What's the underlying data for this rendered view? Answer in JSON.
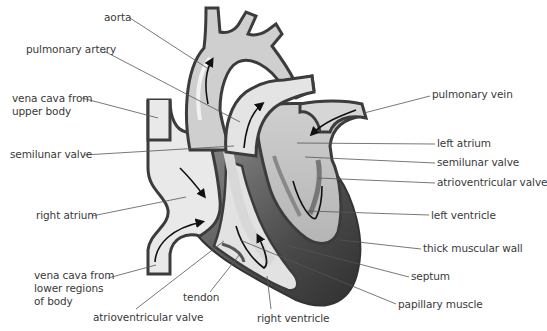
{
  "diagram": {
    "colors": {
      "background": "#ffffff",
      "outline": "#3c3c3c",
      "vessel_fill": "#c9c9c9",
      "vessel_highlight": "#ececec",
      "chamber_light": "#e6e6e6",
      "left_side_fill": "#bdbdbd",
      "muscle_dark": "#555555",
      "leader_line": "#555555",
      "text": "#3a3a3a"
    },
    "labels": [
      {
        "id": "aorta",
        "text": "aorta",
        "x": 104,
        "y": 11,
        "align": "left",
        "line": [
          [
            130,
            18
          ],
          [
            207,
            68
          ]
        ]
      },
      {
        "id": "pulmonary-artery",
        "text": "pulmonary artery",
        "x": 26,
        "y": 43,
        "align": "left",
        "line": [
          [
            104,
            51
          ],
          [
            240,
            122
          ]
        ]
      },
      {
        "id": "vena-cava-upper",
        "text": "vena cava from\nupper body",
        "x": 12,
        "y": 92,
        "align": "left",
        "line": [
          [
            82,
            98
          ],
          [
            158,
            118
          ]
        ]
      },
      {
        "id": "semilunar-valve-left",
        "text": "semilunar valve",
        "x": 10,
        "y": 148,
        "align": "left",
        "line": [
          [
            84,
            155
          ],
          [
            234,
            146
          ]
        ]
      },
      {
        "id": "pulmonary-vein",
        "text": "pulmonary vein",
        "x": 432,
        "y": 88,
        "align": "left",
        "line": [
          [
            430,
            96
          ],
          [
            364,
            113
          ]
        ]
      },
      {
        "id": "left-atrium",
        "text": "left atrium",
        "x": 437,
        "y": 137,
        "align": "left",
        "line": [
          [
            435,
            144
          ],
          [
            297,
            143
          ]
        ]
      },
      {
        "id": "semilunar-valve-right",
        "text": "semilunar valve",
        "x": 437,
        "y": 156,
        "align": "left",
        "line": [
          [
            435,
            163
          ],
          [
            305,
            157
          ]
        ]
      },
      {
        "id": "atrioventricular-valve-right",
        "text": "atrioventricular valve",
        "x": 437,
        "y": 176,
        "align": "left",
        "line": [
          [
            435,
            183
          ],
          [
            318,
            178
          ]
        ]
      },
      {
        "id": "right-atrium",
        "text": "right atrium",
        "x": 36,
        "y": 209,
        "align": "left",
        "line": [
          [
            92,
            216
          ],
          [
            186,
            197
          ]
        ]
      },
      {
        "id": "left-ventricle",
        "text": "left ventricle",
        "x": 431,
        "y": 209,
        "align": "left",
        "line": [
          [
            429,
            215
          ],
          [
            307,
            211
          ]
        ]
      },
      {
        "id": "thick-muscular-wall",
        "text": "thick muscular wall",
        "x": 423,
        "y": 242,
        "align": "left",
        "line": [
          [
            421,
            249
          ],
          [
            340,
            240
          ]
        ]
      },
      {
        "id": "vena-cava-lower",
        "text": "vena cava from\nlower regions\nof body",
        "x": 34,
        "y": 269,
        "align": "left",
        "line": [
          [
            108,
            278
          ],
          [
            156,
            265
          ]
        ]
      },
      {
        "id": "septum",
        "text": "septum",
        "x": 411,
        "y": 270,
        "align": "left",
        "line": [
          [
            409,
            277
          ],
          [
            286,
            245
          ]
        ]
      },
      {
        "id": "papillary-muscle",
        "text": "papillary muscle",
        "x": 398,
        "y": 298,
        "align": "left",
        "line": [
          [
            396,
            304
          ],
          [
            240,
            240
          ]
        ]
      },
      {
        "id": "tendon",
        "text": "tendon",
        "x": 183,
        "y": 291,
        "align": "left",
        "line": [
          [
            210,
            292
          ],
          [
            240,
            254
          ]
        ]
      },
      {
        "id": "atrioventricular-valve-left",
        "text": "atrioventricular valve",
        "x": 93,
        "y": 311,
        "align": "left",
        "line": [
          [
            136,
            309
          ],
          [
            224,
            241
          ]
        ]
      },
      {
        "id": "right-ventricle",
        "text": "right ventricle",
        "x": 257,
        "y": 312,
        "align": "left",
        "line": [
          [
            271,
            309
          ],
          [
            267,
            276
          ]
        ]
      }
    ]
  }
}
